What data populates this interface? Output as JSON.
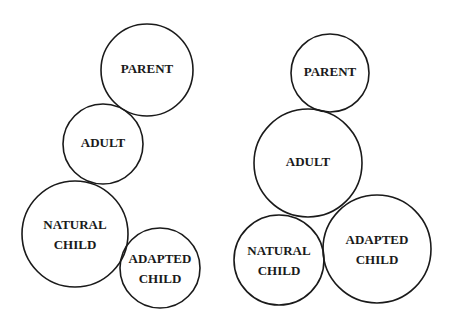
{
  "diagrams": [
    {
      "name": "left",
      "circles": [
        {
          "id": "parent",
          "line1": "PARENT",
          "line2": "",
          "cx": 147,
          "cy": 70,
          "r": 46,
          "font": 13
        },
        {
          "id": "adult",
          "line1": "ADULT",
          "line2": "",
          "cx": 103,
          "cy": 144,
          "r": 40,
          "font": 13
        },
        {
          "id": "natural-child",
          "line1": "NATURAL",
          "line2": "CHILD",
          "cx": 75,
          "cy": 234,
          "r": 53,
          "font": 13
        },
        {
          "id": "adapted-child",
          "line1": "ADAPTED",
          "line2": "CHILD",
          "cx": 160,
          "cy": 268,
          "r": 40,
          "font": 13
        }
      ]
    },
    {
      "name": "right",
      "circles": [
        {
          "id": "parent",
          "line1": "PARENT",
          "line2": "",
          "cx": 330,
          "cy": 73,
          "r": 39,
          "font": 13
        },
        {
          "id": "adult",
          "line1": "ADULT",
          "line2": "",
          "cx": 308,
          "cy": 163,
          "r": 54,
          "font": 13
        },
        {
          "id": "natural-child",
          "line1": "NATURAL",
          "line2": "CHILD",
          "cx": 279,
          "cy": 260,
          "r": 45,
          "font": 13
        },
        {
          "id": "adapted-child",
          "line1": "ADAPTED",
          "line2": "CHILD",
          "cx": 377,
          "cy": 249,
          "r": 54,
          "font": 13
        }
      ]
    }
  ],
  "colors": {
    "stroke": "#1a1a1a",
    "text": "#1a1a1a",
    "background": "#ffffff"
  }
}
